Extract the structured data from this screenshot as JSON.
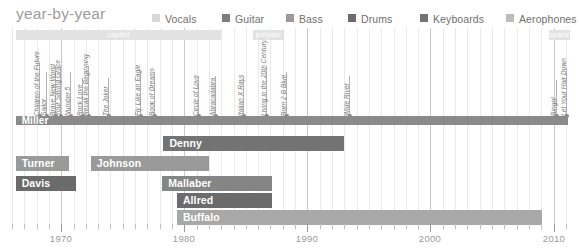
{
  "header": {
    "title": "year-by-year",
    "legend": [
      {
        "label": "Vocals",
        "color": "#d8d8d8",
        "x": 152
      },
      {
        "label": "Guitar",
        "color": "#7d7d7d",
        "x": 222
      },
      {
        "label": "Bass",
        "color": "#9a9a9a",
        "x": 286
      },
      {
        "label": "Drums",
        "color": "#6b6b6b",
        "x": 348
      },
      {
        "label": "Keyboards",
        "color": "#737373",
        "x": 420
      },
      {
        "label": "Aerophones",
        "color": "#bdbdbd",
        "x": 506
      }
    ]
  },
  "chart_data": {
    "type": "bar",
    "chart_subtype": "gantt-timeline",
    "title": "year-by-year",
    "xlabel": "",
    "ylabel": "",
    "xlim": [
      1966.0,
      2011.5
    ],
    "grid": true,
    "legend_position": "top-right",
    "axis": {
      "major_ticks": [
        1970,
        1980,
        1990,
        2000,
        2010
      ],
      "tick_labels": [
        "1970",
        "1980",
        "1990",
        "2000",
        "2010"
      ],
      "minor_tick_step": 1,
      "minor_tick_start": 1966,
      "minor_tick_end": 2011
    },
    "categories": [
      "Miller",
      "Denny",
      "Turner",
      "Johnson",
      "Davis",
      "Mallaber",
      "Allred",
      "Buffalo"
    ],
    "series": [
      {
        "name": "Miller",
        "instrument": "Guitar",
        "color": "#8a8a8a",
        "start": 1966.3,
        "end": 2011.2,
        "row": 0,
        "label": "Miller"
      },
      {
        "name": "Denny",
        "instrument": "Keyboards",
        "color": "#737373",
        "start": 1978.3,
        "end": 1993.0,
        "row": 1,
        "label": "Denny"
      },
      {
        "name": "Turner",
        "instrument": "Bass",
        "color": "#9a9a9a",
        "start": 1966.3,
        "end": 1970.6,
        "row": 2,
        "label": "Turner"
      },
      {
        "name": "Johnson",
        "instrument": "Bass",
        "color": "#9a9a9a",
        "start": 1972.4,
        "end": 1982.0,
        "row": 2,
        "label": "Johnson"
      },
      {
        "name": "Davis",
        "instrument": "Drums",
        "color": "#6b6b6b",
        "start": 1966.3,
        "end": 1971.2,
        "row": 3,
        "label": "Davis"
      },
      {
        "name": "Mallaber",
        "instrument": "Drums",
        "color": "#858585",
        "start": 1978.2,
        "end": 1987.1,
        "row": 3,
        "label": "Mallaber"
      },
      {
        "name": "Allred",
        "instrument": "Drums",
        "color": "#6b6b6b",
        "start": 1979.4,
        "end": 1987.1,
        "row": 4,
        "label": "Allred"
      },
      {
        "name": "Buffalo",
        "instrument": "Aerophones",
        "color": "#a8a8a8",
        "start": 1979.4,
        "end": 2009.1,
        "row": 5,
        "label": "Buffalo"
      }
    ],
    "record_labels": [
      {
        "name": "capitol",
        "start": 1966.3,
        "end": 1983.0,
        "color": "#e2e2e2"
      },
      {
        "name": "polydor",
        "start": 1985.6,
        "end": 1988.1,
        "color": "#e2e2e2"
      },
      {
        "name": "space cowboy",
        "start": 2009.6,
        "end": 2011.3,
        "color": "#e2e2e2"
      }
    ],
    "albums": [
      {
        "title": "Children of the Future",
        "year": 1968.2,
        "stem": 54
      },
      {
        "title": "Sailor",
        "year": 1968.8,
        "stem": 44
      },
      {
        "title": "Brave New World",
        "year": 1969.5,
        "stem": 50
      },
      {
        "title": "Your Saving Grace",
        "year": 1969.9,
        "stem": 50
      },
      {
        "title": "Number 5",
        "year": 1970.7,
        "stem": 44
      },
      {
        "title": "Rock Love",
        "year": 1971.7,
        "stem": 38
      },
      {
        "title": "Recall the Beginning",
        "year": 1972.2,
        "stem": 50
      },
      {
        "title": "The Joker",
        "year": 1973.8,
        "stem": 38
      },
      {
        "title": "Fly Like an Eagle",
        "year": 1976.4,
        "stem": 44
      },
      {
        "title": "Book of Dreams",
        "year": 1977.5,
        "stem": 44
      },
      {
        "title": "Circle of Love",
        "year": 1981.1,
        "stem": 40
      },
      {
        "title": "Abracadabra",
        "year": 1982.5,
        "stem": 40
      },
      {
        "title": "Italian X Rays",
        "year": 1984.8,
        "stem": 40
      },
      {
        "title": "Living in the 20th Century",
        "year": 1986.6,
        "stem": 50
      },
      {
        "title": "Born 2 B Blue",
        "year": 1988.3,
        "stem": 44
      },
      {
        "title": "Wide River",
        "year": 1993.4,
        "stem": 40
      },
      {
        "title": "Bingo!",
        "year": 2010.2,
        "stem": 36
      },
      {
        "title": "Let Your Hair Down",
        "year": 2011.0,
        "stem": 48
      }
    ]
  }
}
